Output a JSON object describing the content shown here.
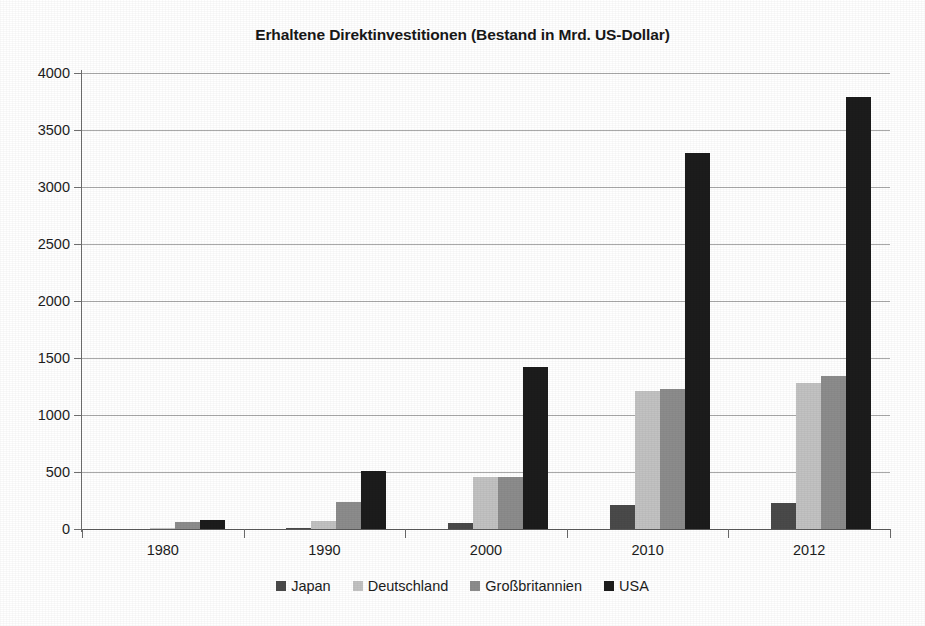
{
  "chart_data": {
    "type": "bar",
    "title": "Erhaltene Direktinvestitionen (Bestand in Mrd. US-Dollar)",
    "subtitle": "",
    "xlabel": "",
    "ylabel": "",
    "categories": [
      "1980",
      "1990",
      "2000",
      "2010",
      "2012"
    ],
    "series": [
      {
        "name": "Japan",
        "color": "#4a4a4a",
        "values": [
          3,
          10,
          50,
          215,
          225
        ]
      },
      {
        "name": "Deutschland",
        "color": "#c2c2c2",
        "values": [
          10,
          70,
          460,
          1210,
          1280
        ]
      },
      {
        "name": "Großbritannien",
        "color": "#8c8c8c",
        "values": [
          63,
          235,
          460,
          1230,
          1340
        ]
      },
      {
        "name": "USA",
        "color": "#1c1c1c",
        "values": [
          83,
          505,
          1420,
          3300,
          3790
        ]
      }
    ],
    "ylim": [
      0,
      4000
    ],
    "ytick_step": 500,
    "yticks": [
      "4000",
      "3500",
      "3000",
      "2500",
      "2000",
      "1500",
      "1000",
      "500",
      "0"
    ],
    "grid": true,
    "grid_axis": "y",
    "legend_position": "bottom"
  },
  "legend": {
    "items": [
      {
        "label": "Japan",
        "color": "#4a4a4a"
      },
      {
        "label": "Deutschland",
        "color": "#c2c2c2"
      },
      {
        "label": "Großbritannien",
        "color": "#8c8c8c"
      },
      {
        "label": "USA",
        "color": "#1c1c1c"
      }
    ]
  }
}
